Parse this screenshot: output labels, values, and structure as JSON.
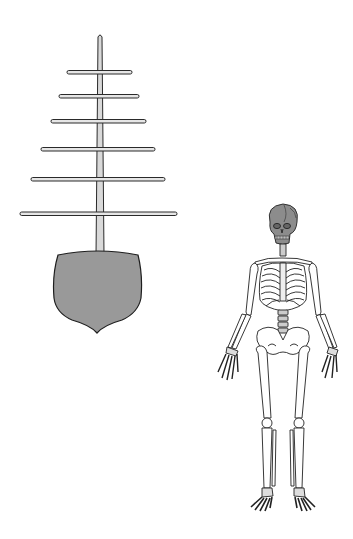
{
  "figure": {
    "ship": {
      "label": "ship-front-view",
      "mast": {
        "x": 100,
        "top": 34,
        "bottom": 256,
        "width": 7,
        "fill": "#d9d9d9"
      },
      "yards": [
        {
          "y": 72,
          "x1": 67,
          "x2": 132
        },
        {
          "y": 96,
          "x1": 59,
          "x2": 139
        },
        {
          "y": 121,
          "x1": 51,
          "x2": 146
        },
        {
          "y": 149,
          "x1": 41,
          "x2": 155
        },
        {
          "y": 179,
          "x1": 31,
          "x2": 165
        },
        {
          "y": 214,
          "x1": 20,
          "x2": 177
        }
      ],
      "hull": {
        "fill": "#999999",
        "stroke": "#222222"
      }
    },
    "skeleton": {
      "label": "human-skeleton-front-view",
      "skull_fill": "#8c8c8c",
      "bone_fill": "#ffffff",
      "stroke": "#222222"
    }
  }
}
